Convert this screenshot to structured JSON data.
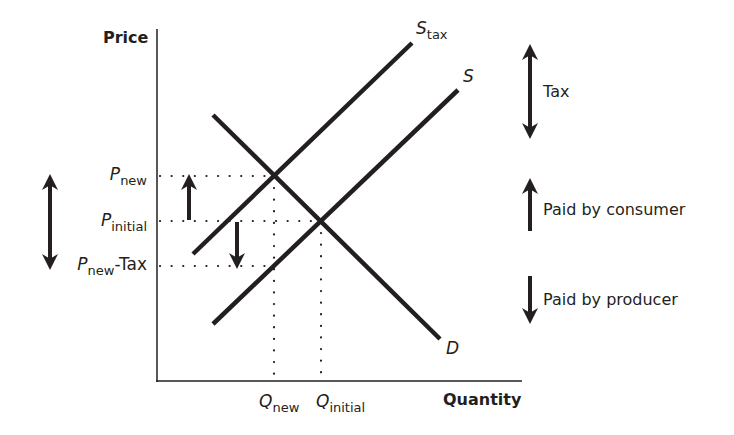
{
  "diagram": {
    "type": "tax-incidence-supply-demand",
    "axes": {
      "y_label": "Price",
      "x_label": "Quantity"
    },
    "curves": [
      {
        "id": "demand",
        "label": "D",
        "sub": ""
      },
      {
        "id": "supply",
        "label": "S",
        "sub": ""
      },
      {
        "id": "supply_tax",
        "label": "S",
        "sub": "tax"
      }
    ],
    "price_ticks": [
      {
        "main": "P",
        "sub": "new",
        "suffix": ""
      },
      {
        "main": "P",
        "sub": "initial",
        "suffix": ""
      },
      {
        "main": "P",
        "sub": "new",
        "suffix": "-Tax"
      }
    ],
    "quantity_ticks": [
      {
        "main": "Q",
        "sub": "new"
      },
      {
        "main": "Q",
        "sub": "initial"
      }
    ],
    "legend": [
      {
        "arrow": "double-arrow",
        "label": "Tax"
      },
      {
        "arrow": "up-arrow",
        "label": "Paid by consumer"
      },
      {
        "arrow": "down-arrow",
        "label": "Paid by producer"
      }
    ],
    "colors": {
      "ink": "#231f20",
      "background": "#ffffff"
    }
  }
}
